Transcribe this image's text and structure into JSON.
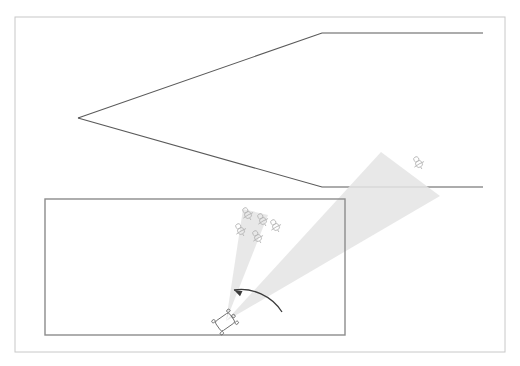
{
  "diagram": {
    "canvas": {
      "width": 520,
      "height": 366,
      "background": "#ffffff"
    },
    "colors": {
      "outer_frame_stroke": "#c8c8c8",
      "room_stroke": "#8c8c8c",
      "corridor_stroke": "#5a5a5a",
      "cone_fill": "#e4e4e4",
      "person_stroke": "#b4b4b4",
      "robot_stroke": "#6e6e6e",
      "arrow_stroke": "#3c3c3c"
    },
    "outer_frame": {
      "name": "outer-frame",
      "x": 15,
      "y": 17,
      "width": 490,
      "height": 335,
      "stroke_width": 1
    },
    "room": {
      "name": "inner-room",
      "x": 45,
      "y": 199,
      "width": 300,
      "height": 136,
      "stroke_width": 1.4
    },
    "corridor": {
      "name": "corridor-walls",
      "stroke_width": 1.1,
      "upper_wall_points": "78,118 322,33 483,33",
      "lower_wall_points": "78,118 322,187 483,187"
    },
    "robot": {
      "name": "robot",
      "x": 225,
      "y": 322,
      "body_width": 17,
      "body_height": 12,
      "rotation_deg": -35
    },
    "cones": [
      {
        "name": "cone-left-current",
        "label": "current field of view",
        "points": "226,321 243,209 268,215",
        "opacity": 0.85
      },
      {
        "name": "cone-right-target",
        "label": "target field of view",
        "points": "226,321 381,152 440,196",
        "opacity": 0.85
      }
    ],
    "rotation_arrow": {
      "name": "rotation-arrow",
      "label": "pan direction",
      "path": "M 282,312 C 272,296 252,287 234,290",
      "arrow_tip": {
        "x": 234,
        "y": 290
      },
      "stroke_width": 1.3
    },
    "person_groups": [
      {
        "name": "person-cluster-in-room",
        "count": 5,
        "positions": [
          {
            "x": 248,
            "y": 215,
            "rotation_deg": -30
          },
          {
            "x": 263,
            "y": 221,
            "rotation_deg": -30
          },
          {
            "x": 276,
            "y": 227,
            "rotation_deg": -30
          },
          {
            "x": 241,
            "y": 231,
            "rotation_deg": -30
          },
          {
            "x": 258,
            "y": 238,
            "rotation_deg": -30
          }
        ]
      },
      {
        "name": "person-single-in-corridor",
        "count": 1,
        "positions": [
          {
            "x": 419,
            "y": 164,
            "rotation_deg": -30
          }
        ]
      }
    ],
    "person_glyph": {
      "head_radius": 2.6,
      "body_radius": 3.4,
      "stroke_width": 0.8
    }
  }
}
